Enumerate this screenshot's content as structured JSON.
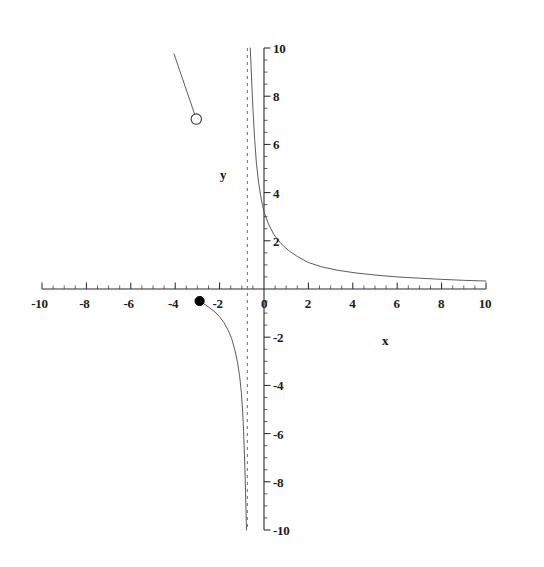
{
  "chart_data": {
    "type": "line",
    "title": "",
    "subtitle": "",
    "xlabel": "x",
    "ylabel": "y",
    "xlim": [
      -10,
      10
    ],
    "ylim": [
      -10,
      10
    ],
    "grid": false,
    "legend": "none",
    "x_ticks": [
      -10,
      -8,
      -6,
      -4,
      -2,
      0,
      2,
      4,
      6,
      8,
      10
    ],
    "x_tick_labels": [
      "-10",
      "-8",
      "-6",
      "-4",
      "-2",
      "0",
      "2",
      "4",
      "6",
      "8",
      "10"
    ],
    "y_ticks": [
      -10,
      -8,
      -6,
      -4,
      -2,
      0,
      2,
      4,
      6,
      8,
      10
    ],
    "y_tick_labels": [
      "-10",
      "-8",
      "-6",
      "-4",
      "-2",
      "0",
      "2",
      "4",
      "6",
      "8",
      "10"
    ],
    "minor_tick_step": 0.5,
    "asymptotes": [
      {
        "kind": "vertical",
        "x": -0.75,
        "style": "dashed"
      }
    ],
    "points": [
      {
        "kind": "open-circle",
        "x": -3.05,
        "y": 7.05,
        "label": "hole"
      },
      {
        "kind": "filled-dot",
        "x": -2.9,
        "y": -0.5,
        "label": "endpoint"
      }
    ],
    "series": [
      {
        "name": "branch-upper-right",
        "style": "solid-thin",
        "x": [
          -0.62,
          -0.58,
          -0.54,
          -0.5,
          -0.42,
          -0.34,
          -0.24,
          -0.12,
          0.0,
          0.2,
          0.45,
          0.75,
          1.1,
          1.5,
          2.0,
          2.6,
          3.3,
          4.1,
          5.0,
          6.0,
          7.0,
          8.0,
          9.0,
          10.0
        ],
        "y": [
          10.0,
          9.2,
          8.3,
          7.5,
          6.2,
          5.2,
          4.4,
          3.7,
          3.2,
          2.7,
          2.25,
          1.9,
          1.6,
          1.35,
          1.1,
          0.92,
          0.78,
          0.67,
          0.58,
          0.5,
          0.45,
          0.4,
          0.36,
          0.33
        ]
      },
      {
        "name": "branch-lower-left",
        "style": "solid-thin",
        "x": [
          -2.9,
          -2.7,
          -2.45,
          -2.2,
          -2.0,
          -1.8,
          -1.62,
          -1.46,
          -1.32,
          -1.2,
          -1.1,
          -1.02,
          -0.96,
          -0.92,
          -0.88,
          -0.85,
          -0.83,
          -0.81,
          -0.795,
          -0.785
        ],
        "y": [
          -0.5,
          -0.62,
          -0.78,
          -0.96,
          -1.15,
          -1.4,
          -1.7,
          -2.05,
          -2.5,
          -3.0,
          -3.6,
          -4.3,
          -5.1,
          -5.9,
          -6.9,
          -7.8,
          -8.5,
          -9.2,
          -9.7,
          -10.0
        ]
      },
      {
        "name": "segment-upper-left",
        "style": "solid-thin",
        "x": [
          -4.05,
          -3.05
        ],
        "y": [
          9.75,
          7.05
        ]
      }
    ]
  },
  "axes": {
    "x_label": "x",
    "y_label": "y"
  }
}
